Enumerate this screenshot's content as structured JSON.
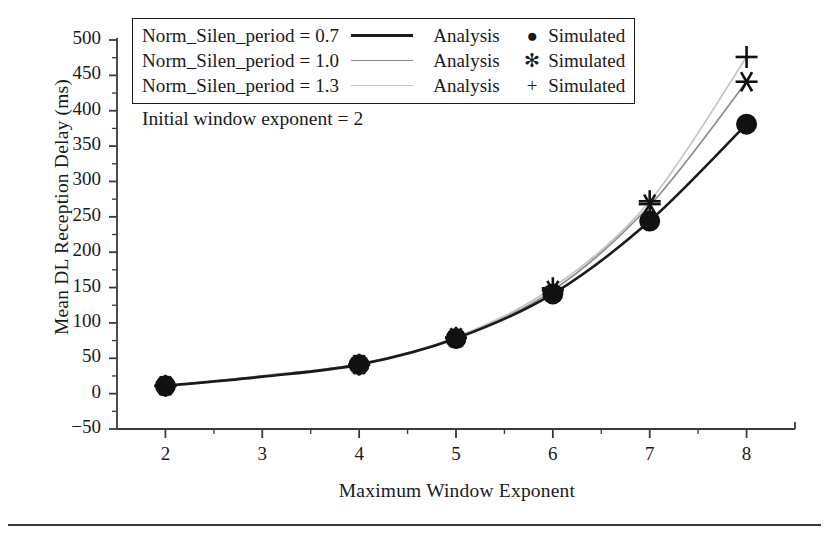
{
  "chart_data": {
    "type": "line",
    "title": "",
    "xlabel": "Maximum Window Exponent",
    "ylabel": "Mean DL Reception Delay (ms)",
    "xlim": [
      1.5,
      8.5
    ],
    "ylim": [
      -50,
      500
    ],
    "xticks": [
      2,
      3,
      4,
      5,
      6,
      7,
      8
    ],
    "yticks": [
      -50,
      0,
      50,
      100,
      150,
      200,
      250,
      300,
      350,
      400,
      450,
      500
    ],
    "minor_ticks": true,
    "grid": false,
    "legend_position": "top-left",
    "annotation": "Initial window exponent = 2",
    "series": [
      {
        "name": "Norm_Silen_period = 0.7 Analysis",
        "kind": "line",
        "color": "#1a1a1a",
        "width": 2.6,
        "x": [
          2,
          3,
          4,
          5,
          6,
          7,
          8
        ],
        "y": [
          11,
          24,
          41,
          78,
          141,
          244,
          381
        ]
      },
      {
        "name": "Norm_Silen_period = 1.0 Analysis",
        "kind": "line",
        "color": "#8c8c8c",
        "width": 1.7,
        "x": [
          2,
          3,
          4,
          5,
          6,
          7,
          8
        ],
        "y": [
          11,
          25,
          42,
          79,
          146,
          266,
          441
        ]
      },
      {
        "name": "Norm_Silen_period = 1.3 Analysis",
        "kind": "line",
        "color": "#c4c4c4",
        "width": 1.7,
        "x": [
          2,
          3,
          4,
          5,
          6,
          7,
          8
        ],
        "y": [
          11,
          25,
          42,
          80,
          150,
          272,
          476
        ]
      },
      {
        "name": "Norm_Silen_period = 0.7 Simulated",
        "kind": "marker",
        "marker": "circle",
        "color": "#111111",
        "x": [
          2,
          4,
          5,
          6,
          7,
          8
        ],
        "y": [
          11,
          41,
          78,
          141,
          244,
          381
        ]
      },
      {
        "name": "Norm_Silen_period = 1.0 Simulated",
        "kind": "marker",
        "marker": "asterisk",
        "color": "#111111",
        "x": [
          2,
          4,
          5,
          6,
          7,
          8
        ],
        "y": [
          11,
          41,
          79,
          146,
          268,
          441
        ]
      },
      {
        "name": "Norm_Silen_period = 1.3 Simulated",
        "kind": "marker",
        "marker": "plus",
        "color": "#111111",
        "x": [
          2,
          4,
          5,
          6,
          7,
          8
        ],
        "y": [
          11,
          41,
          79,
          149,
          272,
          476
        ]
      }
    ]
  },
  "axes": {
    "y_title": "Mean DL Reception Delay (ms)",
    "x_title": "Maximum Window Exponent",
    "y_tick_labels": [
      "500",
      "450",
      "400",
      "350",
      "300",
      "250",
      "200",
      "150",
      "100",
      "50",
      "0",
      "−50"
    ],
    "x_tick_labels": [
      "2",
      "3",
      "4",
      "5",
      "6",
      "7",
      "8"
    ]
  },
  "legend": {
    "rows": [
      {
        "condition": "Norm_Silen_period = 0.7",
        "line_label": "Analysis",
        "marker_glyph": "●",
        "marker_label": "Simulated",
        "line_color": "#1a1a1a"
      },
      {
        "condition": "Norm_Silen_period = 1.0",
        "line_label": "Analysis",
        "marker_glyph": "✻",
        "marker_label": "Simulated",
        "line_color": "#8c8c8c"
      },
      {
        "condition": "Norm_Silen_period = 1.3",
        "line_label": "Analysis",
        "marker_glyph": "+",
        "marker_label": "Simulated",
        "line_color": "#c4c4c4"
      }
    ]
  },
  "annotation": {
    "text": "Initial window exponent = 2"
  }
}
